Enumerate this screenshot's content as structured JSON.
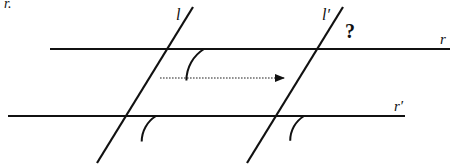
{
  "diagram": {
    "type": "geometry",
    "corner_fragment": "r.",
    "lines": {
      "r": {
        "label": "r",
        "x1": 50,
        "y1": 49,
        "x2": 450,
        "y2": 49,
        "label_x": 440,
        "label_y": 44
      },
      "r_prime": {
        "label": "r′",
        "x1": 8,
        "y1": 116,
        "x2": 405,
        "y2": 116,
        "label_x": 394,
        "label_y": 111
      },
      "l": {
        "label": "l",
        "x1": 193,
        "y1": 7,
        "x2": 97,
        "y2": 163,
        "label_x": 176,
        "label_y": 20
      },
      "l_prime": {
        "label": "l′",
        "x1": 343,
        "y1": 7,
        "x2": 247,
        "y2": 163,
        "label_x": 322,
        "label_y": 20
      }
    },
    "angle_marks": [
      {
        "at": "l ∩ r",
        "cx": 167,
        "cy": 49,
        "radius": 37
      },
      {
        "at": "l ∩ r′",
        "cx": 126,
        "cy": 116,
        "radius": 30
      },
      {
        "at": "l′ ∩ r′",
        "cx": 275,
        "cy": 116,
        "radius": 29
      }
    ],
    "unknown_angle": {
      "symbol": "?",
      "x": 345,
      "y": 38
    },
    "translation_arrow": {
      "x1": 160,
      "y1": 78,
      "x2": 284,
      "y2": 78,
      "style": "dotted"
    },
    "colors": {
      "ink": "#111111",
      "background": "#ffffff"
    }
  }
}
